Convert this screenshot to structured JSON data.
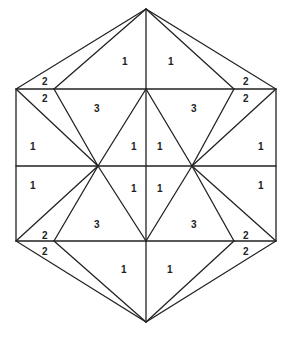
{
  "diagram": {
    "type": "hexagon-triangulation",
    "stroke_color": "#222222",
    "background": "#ffffff",
    "vertices": {
      "top": [
        146,
        9
      ],
      "upper_left": [
        16,
        89
      ],
      "upper_right": [
        276,
        89
      ],
      "lower_left": [
        16,
        241
      ],
      "lower_right": [
        276,
        241
      ],
      "bottom": [
        146,
        322
      ],
      "upper_inner_left": [
        54,
        89
      ],
      "upper_inner_right": [
        234,
        89
      ],
      "upper_center": [
        146,
        89
      ],
      "lower_inner_left": [
        54,
        241
      ],
      "lower_inner_right": [
        234,
        241
      ],
      "lower_center": [
        146,
        241
      ],
      "mid_left": [
        16,
        166
      ],
      "mid_right": [
        276,
        166
      ],
      "mid_left_node": [
        98,
        166
      ],
      "mid_right_node": [
        192,
        166
      ],
      "mid_center": [
        146,
        166
      ]
    },
    "labels": [
      {
        "text": "1",
        "x": 122,
        "y": 61
      },
      {
        "text": "1",
        "x": 168,
        "y": 61
      },
      {
        "text": "2",
        "x": 45,
        "y": 81
      },
      {
        "text": "2",
        "x": 45,
        "y": 98
      },
      {
        "text": "2",
        "x": 245,
        "y": 81
      },
      {
        "text": "2",
        "x": 245,
        "y": 98
      },
      {
        "text": "3",
        "x": 97,
        "y": 111
      },
      {
        "text": "3",
        "x": 193,
        "y": 111
      },
      {
        "text": "1",
        "x": 31,
        "y": 148
      },
      {
        "text": "1",
        "x": 133,
        "y": 148
      },
      {
        "text": "1",
        "x": 159,
        "y": 148
      },
      {
        "text": "1",
        "x": 259,
        "y": 148
      },
      {
        "text": "1",
        "x": 31,
        "y": 187
      },
      {
        "text": "1",
        "x": 133,
        "y": 190
      },
      {
        "text": "1",
        "x": 159,
        "y": 190
      },
      {
        "text": "1",
        "x": 259,
        "y": 187
      },
      {
        "text": "3",
        "x": 97,
        "y": 226
      },
      {
        "text": "3",
        "x": 193,
        "y": 226
      },
      {
        "text": "2",
        "x": 45,
        "y": 236
      },
      {
        "text": "2",
        "x": 45,
        "y": 252
      },
      {
        "text": "2",
        "x": 245,
        "y": 236
      },
      {
        "text": "2",
        "x": 245,
        "y": 252
      },
      {
        "text": "1",
        "x": 122,
        "y": 272
      },
      {
        "text": "1",
        "x": 168,
        "y": 272
      }
    ]
  }
}
